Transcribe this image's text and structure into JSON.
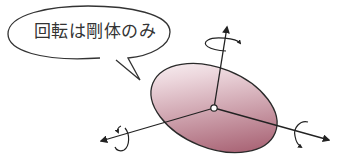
{
  "speech_bubble": {
    "text": "回転は剛体のみ"
  },
  "diagram": {
    "fill_color_dark": "#8a3a4e",
    "fill_color_light": "#f4e6ea",
    "stroke_color": "#2a2a2a",
    "axes": [
      {
        "name": "vertical-axis",
        "rotation_arrow": true
      },
      {
        "name": "left-axis",
        "rotation_arrow": true
      },
      {
        "name": "right-axis",
        "rotation_arrow": true
      }
    ]
  }
}
